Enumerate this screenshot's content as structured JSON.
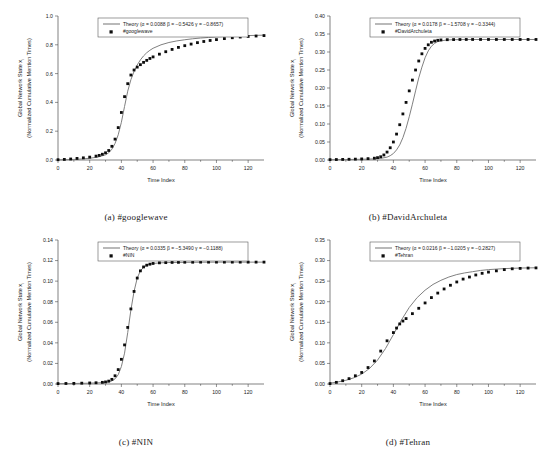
{
  "figure": {
    "panel_count": 4,
    "shared": {
      "xlabel": "Time Index",
      "ylabel_line1": "Global Network State x",
      "ylabel_sub": "i",
      "ylabel_line2": "(Normalized Cumulative Mention Times)",
      "xlim": [
        0,
        130
      ],
      "xticks": [
        0,
        20,
        40,
        60,
        80,
        100,
        120
      ],
      "theory_label_prefix": "Theory (",
      "theory_color": "#808080",
      "data_color": "#0d0d0d"
    }
  },
  "chart_data": [
    {
      "type": "line",
      "panel": "a",
      "caption": "(a)  #googlewave",
      "title": "",
      "xlabel": "Time Index",
      "ylabel": "Global Network State x_i (Normalized Cumulative Mention Times)",
      "xlim": [
        0,
        130
      ],
      "ylim": [
        0.0,
        1.0
      ],
      "xticks": [
        0,
        20,
        40,
        60,
        80,
        100,
        120
      ],
      "yticks": [
        0.0,
        0.2,
        0.4,
        0.6,
        0.8,
        1.0
      ],
      "ytick_labels": [
        "0.0",
        "0.2",
        "0.4",
        "0.6",
        "0.8",
        "1.0"
      ],
      "grid": false,
      "legend_position": "top-center",
      "legend": [
        {
          "name": "Theory (α = 0.0088 β = −0.5426 γ = −0.8657)",
          "marker": "line",
          "alpha": 0.0088,
          "beta": -0.5426,
          "gamma": -0.8657
        },
        {
          "name": "#googlewave",
          "marker": "square"
        }
      ],
      "series": [
        {
          "name": "Theory",
          "kind": "line",
          "x": [
            0,
            5,
            10,
            15,
            20,
            25,
            30,
            32,
            34,
            36,
            38,
            40,
            42,
            44,
            46,
            48,
            50,
            52,
            54,
            56,
            58,
            60,
            65,
            70,
            75,
            80,
            85,
            90,
            95,
            100,
            110,
            120,
            130
          ],
          "y": [
            0.001,
            0.002,
            0.004,
            0.007,
            0.012,
            0.02,
            0.036,
            0.05,
            0.075,
            0.115,
            0.175,
            0.262,
            0.372,
            0.478,
            0.558,
            0.615,
            0.66,
            0.695,
            0.723,
            0.745,
            0.762,
            0.776,
            0.8,
            0.816,
            0.827,
            0.835,
            0.842,
            0.847,
            0.851,
            0.855,
            0.86,
            0.864,
            0.867
          ]
        },
        {
          "name": "#googlewave",
          "kind": "scatter",
          "x": [
            0,
            4,
            8,
            12,
            16,
            20,
            24,
            26,
            28,
            30,
            32,
            34,
            36,
            38,
            40,
            42,
            44,
            46,
            48,
            50,
            52,
            54,
            56,
            58,
            60,
            64,
            68,
            72,
            76,
            80,
            84,
            88,
            92,
            96,
            100,
            105,
            110,
            115,
            120,
            125,
            130
          ],
          "y": [
            0.002,
            0.004,
            0.007,
            0.011,
            0.015,
            0.02,
            0.027,
            0.032,
            0.04,
            0.05,
            0.066,
            0.095,
            0.145,
            0.225,
            0.33,
            0.44,
            0.53,
            0.59,
            0.625,
            0.645,
            0.662,
            0.678,
            0.692,
            0.705,
            0.716,
            0.735,
            0.752,
            0.768,
            0.782,
            0.794,
            0.805,
            0.815,
            0.823,
            0.83,
            0.836,
            0.843,
            0.849,
            0.854,
            0.858,
            0.861,
            0.864
          ]
        }
      ]
    },
    {
      "type": "line",
      "panel": "b",
      "caption": "(b)  #DavidArchuleta",
      "title": "",
      "xlabel": "Time Index",
      "ylabel": "Global Network State x_i (Normalized Cumulative Mention Times)",
      "xlim": [
        0,
        130
      ],
      "ylim": [
        0.0,
        0.4
      ],
      "xticks": [
        0,
        20,
        40,
        60,
        80,
        100,
        120
      ],
      "yticks": [
        0.0,
        0.05,
        0.1,
        0.15,
        0.2,
        0.25,
        0.3,
        0.35,
        0.4
      ],
      "ytick_labels": [
        "0.00",
        "0.05",
        "0.10",
        "0.15",
        "0.20",
        "0.25",
        "0.30",
        "0.35",
        "0.40"
      ],
      "grid": false,
      "legend_position": "top-center",
      "legend": [
        {
          "name": "Theory (α = 0.0178 β = −1.5708 γ = −0.3344)",
          "marker": "line",
          "alpha": 0.0178,
          "beta": -1.5708,
          "gamma": -0.3344
        },
        {
          "name": "#DavidArchuleta",
          "marker": "square"
        }
      ],
      "series": [
        {
          "name": "Theory",
          "kind": "line",
          "x": [
            0,
            10,
            20,
            28,
            32,
            36,
            38,
            40,
            42,
            44,
            46,
            48,
            50,
            52,
            54,
            56,
            58,
            60,
            62,
            64,
            66,
            68,
            70,
            74,
            78,
            82,
            90,
            100,
            110,
            120,
            130
          ],
          "y": [
            0.0008,
            0.0012,
            0.002,
            0.003,
            0.0045,
            0.008,
            0.012,
            0.018,
            0.028,
            0.042,
            0.062,
            0.088,
            0.12,
            0.155,
            0.192,
            0.228,
            0.258,
            0.284,
            0.303,
            0.316,
            0.324,
            0.329,
            0.331,
            0.3335,
            0.3342,
            0.3345,
            0.3347,
            0.3348,
            0.3348,
            0.3348,
            0.3348
          ]
        },
        {
          "name": "#DavidArchuleta",
          "kind": "scatter",
          "x": [
            0,
            4,
            8,
            12,
            16,
            20,
            24,
            28,
            30,
            32,
            34,
            36,
            38,
            40,
            42,
            44,
            46,
            48,
            50,
            52,
            54,
            56,
            58,
            60,
            62,
            64,
            66,
            68,
            70,
            74,
            78,
            82,
            86,
            90,
            95,
            100,
            105,
            110,
            115,
            120,
            125,
            130
          ],
          "y": [
            0.001,
            0.0013,
            0.0016,
            0.002,
            0.0024,
            0.003,
            0.0038,
            0.005,
            0.0065,
            0.009,
            0.014,
            0.022,
            0.034,
            0.05,
            0.072,
            0.098,
            0.128,
            0.16,
            0.192,
            0.222,
            0.25,
            0.275,
            0.295,
            0.31,
            0.32,
            0.327,
            0.3305,
            0.3325,
            0.3335,
            0.3342,
            0.3345,
            0.3347,
            0.3348,
            0.3348,
            0.3348,
            0.3348,
            0.3348,
            0.3348,
            0.3348,
            0.3348,
            0.3348,
            0.3348
          ]
        }
      ]
    },
    {
      "type": "line",
      "panel": "c",
      "caption": "(c)  #NIN",
      "title": "",
      "xlabel": "Time Index",
      "ylabel": "Global Network State x_i (Normalized Cumulative Mention Times)",
      "xlim": [
        0,
        130
      ],
      "ylim": [
        0.0,
        0.14
      ],
      "xticks": [
        0,
        20,
        40,
        60,
        80,
        100,
        120
      ],
      "yticks": [
        0.0,
        0.02,
        0.04,
        0.06,
        0.08,
        0.1,
        0.12,
        0.14
      ],
      "ytick_labels": [
        "0.00",
        "0.02",
        "0.04",
        "0.06",
        "0.08",
        "0.10",
        "0.12",
        "0.14"
      ],
      "grid": false,
      "legend_position": "top-center",
      "legend": [
        {
          "name": "Theory (α = 0.0335 β = −5.3490 γ = −0.1188)",
          "marker": "line",
          "alpha": 0.0335,
          "beta": -5.349,
          "gamma": -0.1188
        },
        {
          "name": "#NIN",
          "marker": "square"
        }
      ],
      "series": [
        {
          "name": "Theory",
          "kind": "line",
          "x": [
            0,
            10,
            20,
            28,
            32,
            34,
            36,
            38,
            40,
            42,
            44,
            46,
            48,
            50,
            52,
            54,
            56,
            58,
            60,
            65,
            70,
            80,
            90,
            100,
            110,
            120,
            130
          ],
          "y": [
            0.0003,
            0.0005,
            0.0008,
            0.0013,
            0.002,
            0.003,
            0.005,
            0.009,
            0.017,
            0.03,
            0.05,
            0.072,
            0.09,
            0.103,
            0.11,
            0.1135,
            0.1155,
            0.1165,
            0.1172,
            0.1178,
            0.1181,
            0.1183,
            0.1184,
            0.1185,
            0.1185,
            0.1185,
            0.1185
          ]
        },
        {
          "name": "#NIN",
          "kind": "scatter",
          "x": [
            0,
            5,
            10,
            15,
            20,
            24,
            28,
            30,
            32,
            34,
            36,
            38,
            40,
            42,
            44,
            46,
            48,
            50,
            52,
            54,
            56,
            58,
            60,
            64,
            68,
            72,
            76,
            80,
            85,
            90,
            95,
            100,
            105,
            110,
            115,
            120,
            125,
            130
          ],
          "y": [
            0.0004,
            0.0005,
            0.0006,
            0.0008,
            0.001,
            0.0012,
            0.0016,
            0.002,
            0.0028,
            0.0045,
            0.008,
            0.014,
            0.024,
            0.038,
            0.055,
            0.073,
            0.09,
            0.103,
            0.11,
            0.1138,
            0.1155,
            0.1165,
            0.1172,
            0.1178,
            0.118,
            0.1182,
            0.1183,
            0.1184,
            0.1184,
            0.1185,
            0.1185,
            0.1185,
            0.1185,
            0.1185,
            0.1185,
            0.1185,
            0.1185,
            0.1185
          ]
        }
      ]
    },
    {
      "type": "line",
      "panel": "d",
      "caption": "(d)  #Tehran",
      "title": "",
      "xlabel": "Time Index",
      "ylabel": "Global Network State x_i (Normalized Cumulative Mention Times)",
      "xlim": [
        0,
        130
      ],
      "ylim": [
        0.0,
        0.35
      ],
      "xticks": [
        0,
        20,
        40,
        60,
        80,
        100,
        120
      ],
      "yticks": [
        0.0,
        0.05,
        0.1,
        0.15,
        0.2,
        0.25,
        0.3,
        0.35
      ],
      "ytick_labels": [
        "0.00",
        "0.05",
        "0.10",
        "0.15",
        "0.20",
        "0.25",
        "0.30",
        "0.35"
      ],
      "grid": false,
      "legend_position": "top-center",
      "legend": [
        {
          "name": "Theory (α = 0.0216 β = −1.0205 γ = −0.2827)",
          "marker": "line",
          "alpha": 0.0216,
          "beta": -1.0205,
          "gamma": -0.2827
        },
        {
          "name": "#Tehran",
          "marker": "square"
        }
      ],
      "series": [
        {
          "name": "Theory",
          "kind": "line",
          "x": [
            0,
            5,
            10,
            15,
            20,
            25,
            30,
            35,
            40,
            45,
            50,
            55,
            60,
            65,
            70,
            75,
            80,
            85,
            90,
            95,
            100,
            110,
            120,
            130
          ],
          "y": [
            0.002,
            0.005,
            0.009,
            0.015,
            0.024,
            0.038,
            0.058,
            0.086,
            0.12,
            0.155,
            0.186,
            0.21,
            0.228,
            0.242,
            0.252,
            0.26,
            0.266,
            0.27,
            0.273,
            0.276,
            0.278,
            0.2805,
            0.2818,
            0.2825
          ]
        },
        {
          "name": "#Tehran",
          "kind": "scatter",
          "x": [
            0,
            4,
            8,
            12,
            16,
            20,
            24,
            28,
            32,
            36,
            40,
            42,
            44,
            46,
            48,
            52,
            56,
            60,
            64,
            68,
            72,
            76,
            80,
            84,
            88,
            92,
            96,
            100,
            105,
            110,
            115,
            120,
            125,
            130
          ],
          "y": [
            0.001,
            0.004,
            0.008,
            0.013,
            0.02,
            0.028,
            0.04,
            0.056,
            0.08,
            0.105,
            0.125,
            0.136,
            0.146,
            0.153,
            0.159,
            0.171,
            0.184,
            0.197,
            0.21,
            0.221,
            0.231,
            0.24,
            0.248,
            0.255,
            0.26,
            0.265,
            0.269,
            0.272,
            0.275,
            0.278,
            0.28,
            0.281,
            0.2818,
            0.2822
          ]
        }
      ]
    }
  ]
}
